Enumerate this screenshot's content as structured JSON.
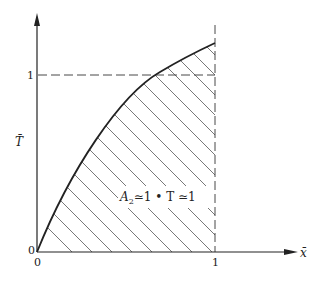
{
  "figure": {
    "y_axis_label": "T̄",
    "x_axis_label": "x̄",
    "y_tick_one": "1",
    "y_tick_zero": "0",
    "x_tick_zero": "0",
    "x_tick_one": "1",
    "annotation": {
      "A": "A",
      "sub": "2",
      "rest": "≃1 • T ≃1"
    }
  },
  "colors": {
    "ink": "#222222",
    "hatch": "#555555",
    "background": "#ffffff"
  }
}
